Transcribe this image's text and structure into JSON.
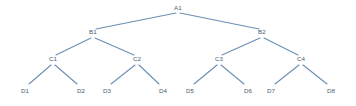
{
  "diagram": {
    "type": "tree",
    "background_color": "#ffffff",
    "edge_color": "#6b8fb4",
    "label_color": "#4a5a70",
    "levels": 4,
    "nodes": [
      {
        "id": "A1",
        "label": "A1",
        "level": 0,
        "x": 178,
        "y": 7,
        "anchor_x": 178,
        "anchor_y": 13
      },
      {
        "id": "B1",
        "label": "B1",
        "level": 1,
        "x": 93,
        "y": 31,
        "anchor_x": 93,
        "anchor_y": 38
      },
      {
        "id": "B2",
        "label": "B2",
        "level": 1,
        "x": 262,
        "y": 31,
        "anchor_x": 262,
        "anchor_y": 38
      },
      {
        "id": "C1",
        "label": "C1",
        "level": 2,
        "x": 53,
        "y": 58,
        "anchor_x": 53,
        "anchor_y": 65
      },
      {
        "id": "C2",
        "label": "C2",
        "level": 2,
        "x": 137,
        "y": 58,
        "anchor_x": 137,
        "anchor_y": 65
      },
      {
        "id": "C3",
        "label": "C3",
        "level": 2,
        "x": 219,
        "y": 58,
        "anchor_x": 219,
        "anchor_y": 65
      },
      {
        "id": "C4",
        "label": "C4",
        "level": 2,
        "x": 301,
        "y": 58,
        "anchor_x": 301,
        "anchor_y": 65
      },
      {
        "id": "D1",
        "label": "D1",
        "level": 3,
        "x": 25,
        "y": 90,
        "anchor_x": 28,
        "anchor_y": 85
      },
      {
        "id": "D2",
        "label": "D2",
        "level": 3,
        "x": 81,
        "y": 90,
        "anchor_x": 78,
        "anchor_y": 85
      },
      {
        "id": "D3",
        "label": "D3",
        "level": 3,
        "x": 107,
        "y": 90,
        "anchor_x": 110,
        "anchor_y": 85
      },
      {
        "id": "D4",
        "label": "D4",
        "level": 3,
        "x": 163,
        "y": 90,
        "anchor_x": 160,
        "anchor_y": 85
      },
      {
        "id": "D5",
        "label": "D5",
        "level": 3,
        "x": 190,
        "y": 90,
        "anchor_x": 193,
        "anchor_y": 85
      },
      {
        "id": "D6",
        "label": "D6",
        "level": 3,
        "x": 248,
        "y": 90,
        "anchor_x": 245,
        "anchor_y": 85
      },
      {
        "id": "D7",
        "label": "D7",
        "level": 3,
        "x": 271,
        "y": 90,
        "anchor_x": 274,
        "anchor_y": 85
      },
      {
        "id": "D8",
        "label": "D8",
        "level": 3,
        "x": 331,
        "y": 90,
        "anchor_x": 328,
        "anchor_y": 85
      }
    ],
    "edges": [
      {
        "from": "A1",
        "to": "B1",
        "x1": 176,
        "y1": 13,
        "x2": 96,
        "y2": 29
      },
      {
        "from": "A1",
        "to": "B2",
        "x1": 180,
        "y1": 13,
        "x2": 259,
        "y2": 29
      },
      {
        "from": "B1",
        "to": "C1",
        "x1": 91,
        "y1": 38,
        "x2": 56,
        "y2": 55
      },
      {
        "from": "B1",
        "to": "C2",
        "x1": 95,
        "y1": 38,
        "x2": 134,
        "y2": 55
      },
      {
        "from": "B2",
        "to": "C3",
        "x1": 260,
        "y1": 38,
        "x2": 222,
        "y2": 55
      },
      {
        "from": "B2",
        "to": "C4",
        "x1": 264,
        "y1": 38,
        "x2": 298,
        "y2": 55
      },
      {
        "from": "C1",
        "to": "D1",
        "x1": 51,
        "y1": 65,
        "x2": 29,
        "y2": 84
      },
      {
        "from": "C1",
        "to": "D2",
        "x1": 55,
        "y1": 65,
        "x2": 77,
        "y2": 84
      },
      {
        "from": "C2",
        "to": "D3",
        "x1": 135,
        "y1": 65,
        "x2": 111,
        "y2": 84
      },
      {
        "from": "C2",
        "to": "D4",
        "x1": 139,
        "y1": 65,
        "x2": 159,
        "y2": 84
      },
      {
        "from": "C3",
        "to": "D5",
        "x1": 217,
        "y1": 65,
        "x2": 194,
        "y2": 84
      },
      {
        "from": "C3",
        "to": "D6",
        "x1": 221,
        "y1": 65,
        "x2": 244,
        "y2": 84
      },
      {
        "from": "C4",
        "to": "D7",
        "x1": 299,
        "y1": 65,
        "x2": 275,
        "y2": 84
      },
      {
        "from": "C4",
        "to": "D8",
        "x1": 303,
        "y1": 65,
        "x2": 327,
        "y2": 84
      }
    ]
  }
}
